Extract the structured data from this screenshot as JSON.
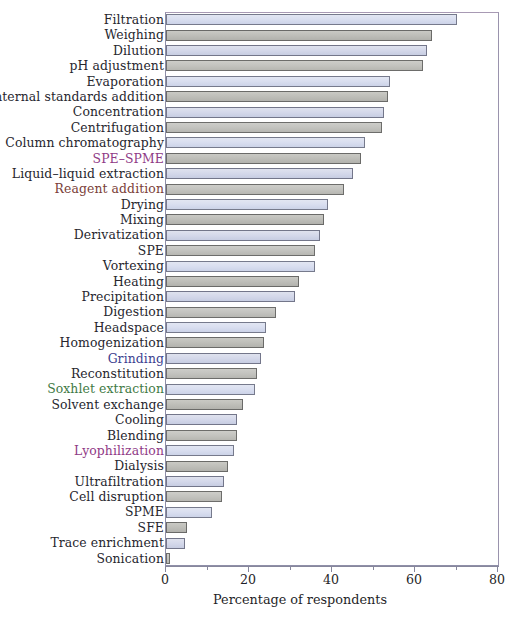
{
  "chart_data": {
    "type": "bar",
    "orientation": "horizontal",
    "title": "",
    "xlabel": "Percentage of respondents",
    "ylabel": "",
    "xlim": [
      0,
      80
    ],
    "ylim": null,
    "grid": false,
    "legend": null,
    "x_ticks_major": [
      0,
      20,
      40,
      60,
      80
    ],
    "x_ticks_minor": [
      10,
      30,
      50,
      70
    ],
    "x_tick_labels": [
      "0",
      "20",
      "40",
      "60",
      "80"
    ],
    "categories": [
      "Filtration",
      "Weighing",
      "Dilution",
      "pH adjustment",
      "Evaporation",
      "Internal standards addition",
      "Concentration",
      "Centrifugation",
      "Column chromatography",
      "SPE–SPME",
      "Liquid–liquid extraction",
      "Reagent addition",
      "Drying",
      "Mixing",
      "Derivatization",
      "SPE",
      "Vortexing",
      "Heating",
      "Precipitation",
      "Digestion",
      "Headspace",
      "Homogenization",
      "Grinding",
      "Reconstitution",
      "Soxhlet extraction",
      "Solvent exchange",
      "Cooling",
      "Blending",
      "Lyophilization",
      "Dialysis",
      "Ultrafiltration",
      "Cell disruption",
      "SPME",
      "SFE",
      "Trace enrichment",
      "Sonication"
    ],
    "values": [
      70,
      64,
      63,
      62,
      54,
      53.5,
      52.5,
      52,
      48,
      47,
      45,
      43,
      39,
      38,
      37,
      36,
      36,
      32,
      31,
      26.5,
      24,
      23.5,
      23,
      22,
      21.5,
      18.5,
      17,
      17,
      16.5,
      15,
      14,
      13.5,
      11,
      5,
      4.5,
      1
    ],
    "label_colors": [
      "default",
      "default",
      "default",
      "default",
      "default",
      "default",
      "default",
      "default",
      "default",
      "magenta",
      "default",
      "rust",
      "default",
      "default",
      "default",
      "default",
      "default",
      "default",
      "default",
      "default",
      "default",
      "default",
      "blue",
      "default",
      "green",
      "default",
      "default",
      "default",
      "magenta",
      "default",
      "default",
      "default",
      "default",
      "default",
      "default",
      "default"
    ],
    "bar_tints": [
      "a",
      "b",
      "c",
      "d",
      "a",
      "b",
      "c",
      "d",
      "a",
      "b",
      "c",
      "d",
      "a",
      "b",
      "c",
      "d",
      "a",
      "b",
      "c",
      "d",
      "a",
      "b",
      "c",
      "d",
      "a",
      "b",
      "c",
      "d",
      "a",
      "b",
      "c",
      "d",
      "a",
      "b",
      "c",
      "d"
    ]
  },
  "axis": {
    "x_title": "Percentage of respondents"
  }
}
